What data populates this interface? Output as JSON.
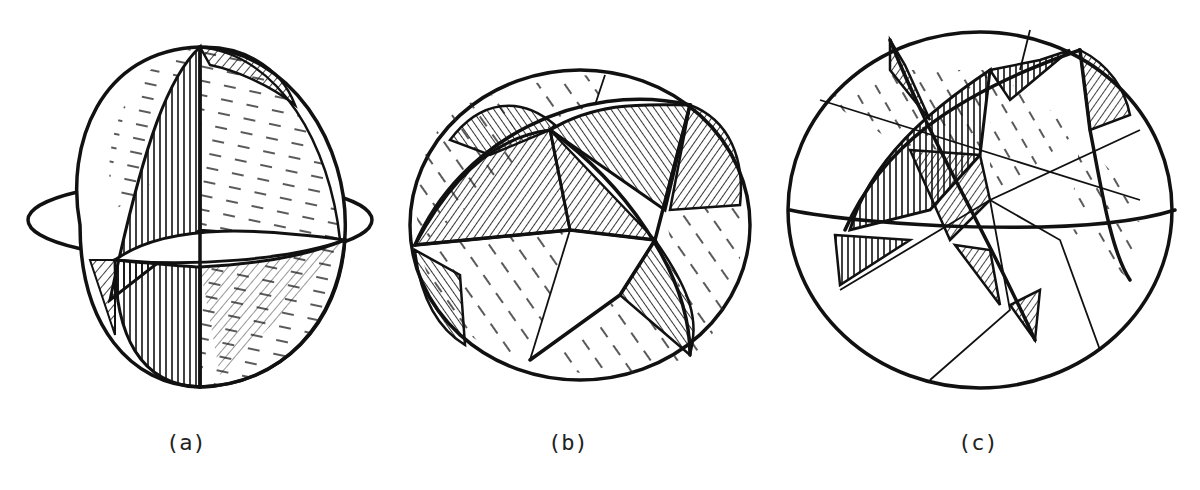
{
  "figures": [
    {
      "id": "a",
      "caption": "(a)",
      "description": "Sphere divided by three mutually perpendicular great circles into 8 octants, with hatched shading"
    },
    {
      "id": "b",
      "caption": "(b)",
      "description": "Sphere divided by four great circles (cuboctahedral arrangement) with hatched triangular and square regions"
    },
    {
      "id": "c",
      "caption": "(c)",
      "description": "Sphere divided by six great circles into many triangular regions with hatched shading"
    }
  ],
  "colors": {
    "ink": "#111111",
    "background": "#ffffff"
  }
}
